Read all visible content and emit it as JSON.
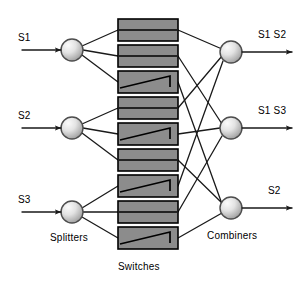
{
  "diagram": {
    "colors": {
      "line": "#1a1a1a",
      "switch_fill": "#8c8c8c",
      "switch_stroke": "#000000",
      "node_light": "#f2f2f2",
      "node_dark": "#9a9a9a",
      "node_stroke": "#4d4d4d",
      "text": "#000000",
      "background": "#ffffff"
    },
    "inputs": [
      {
        "label": "S1",
        "x": 18,
        "y": 33,
        "arrow_y": 50
      },
      {
        "label": "S2",
        "x": 18,
        "y": 111,
        "arrow_y": 128
      },
      {
        "label": "S3",
        "x": 18,
        "y": 195,
        "arrow_y": 212
      }
    ],
    "outputs": [
      {
        "label": "S1 S2",
        "x": 258,
        "y": 30,
        "arrow_y": 52
      },
      {
        "label": "S1 S3",
        "x": 258,
        "y": 106,
        "arrow_y": 128
      },
      {
        "label": "S2",
        "x": 268,
        "y": 186,
        "arrow_y": 208
      }
    ],
    "group_labels": [
      {
        "name": "splitters",
        "text": "Splitters",
        "x": 50,
        "y": 233
      },
      {
        "name": "switches",
        "text": "Switches",
        "x": 118,
        "y": 262
      },
      {
        "name": "combiners",
        "text": "Combiners",
        "x": 207,
        "y": 231
      }
    ],
    "splitters": [
      {
        "name": "splitter-1",
        "cx": 72,
        "cy": 50,
        "r": 11
      },
      {
        "name": "splitter-2",
        "cx": 72,
        "cy": 128,
        "r": 11
      },
      {
        "name": "splitter-3",
        "cx": 72,
        "cy": 212,
        "r": 11
      }
    ],
    "combiners": [
      {
        "name": "combiner-1",
        "cx": 231,
        "cy": 52,
        "r": 11
      },
      {
        "name": "combiner-2",
        "cx": 231,
        "cy": 128,
        "r": 11
      },
      {
        "name": "combiner-3",
        "cx": 231,
        "cy": 208,
        "r": 11
      }
    ],
    "switches": [
      {
        "name": "switch-1",
        "x": 118,
        "y": 19,
        "w": 60,
        "h": 22,
        "state": "bar"
      },
      {
        "name": "switch-2",
        "x": 118,
        "y": 45,
        "w": 60,
        "h": 22,
        "state": "bar"
      },
      {
        "name": "switch-3",
        "x": 118,
        "y": 71,
        "w": 60,
        "h": 22,
        "state": "cross"
      },
      {
        "name": "switch-4",
        "x": 118,
        "y": 97,
        "w": 60,
        "h": 22,
        "state": "bar"
      },
      {
        "name": "switch-5",
        "x": 118,
        "y": 123,
        "w": 60,
        "h": 22,
        "state": "cross"
      },
      {
        "name": "switch-6",
        "x": 118,
        "y": 149,
        "w": 60,
        "h": 22,
        "state": "bar"
      },
      {
        "name": "switch-7",
        "x": 118,
        "y": 175,
        "w": 60,
        "h": 22,
        "state": "cross"
      },
      {
        "name": "switch-8",
        "x": 118,
        "y": 201,
        "w": 60,
        "h": 22,
        "state": "bar"
      },
      {
        "name": "switch-9",
        "x": 118,
        "y": 227,
        "w": 60,
        "h": 22,
        "state": "cross"
      }
    ],
    "input_arrows": [
      {
        "name": "input-arrow-s1",
        "x1": 22,
        "y1": 50,
        "x2": 61,
        "y2": 50
      },
      {
        "name": "input-arrow-s2",
        "x1": 22,
        "y1": 128,
        "x2": 61,
        "y2": 128
      },
      {
        "name": "input-arrow-s3",
        "x1": 22,
        "y1": 212,
        "x2": 61,
        "y2": 212
      }
    ],
    "output_arrows": [
      {
        "name": "output-arrow-1",
        "x1": 242,
        "y1": 52,
        "x2": 292,
        "y2": 52
      },
      {
        "name": "output-arrow-2",
        "x1": 242,
        "y1": 128,
        "x2": 292,
        "y2": 128
      },
      {
        "name": "output-arrow-3",
        "x1": 242,
        "y1": 208,
        "x2": 292,
        "y2": 208
      }
    ],
    "splitter_links": [
      {
        "name": "link-sp1-sw1",
        "x1": 82,
        "y1": 46,
        "x2": 118,
        "y2": 30
      },
      {
        "name": "link-sp1-sw2",
        "x1": 83,
        "y1": 50,
        "x2": 118,
        "y2": 56
      },
      {
        "name": "link-sp1-sw3",
        "x1": 82,
        "y1": 55,
        "x2": 118,
        "y2": 82
      },
      {
        "name": "link-sp2-sw4",
        "x1": 82,
        "y1": 124,
        "x2": 118,
        "y2": 108
      },
      {
        "name": "link-sp2-sw5",
        "x1": 83,
        "y1": 128,
        "x2": 118,
        "y2": 134
      },
      {
        "name": "link-sp2-sw6",
        "x1": 82,
        "y1": 133,
        "x2": 118,
        "y2": 160
      },
      {
        "name": "link-sp3-sw7",
        "x1": 82,
        "y1": 208,
        "x2": 118,
        "y2": 186
      },
      {
        "name": "link-sp3-sw8",
        "x1": 83,
        "y1": 212,
        "x2": 118,
        "y2": 212
      },
      {
        "name": "link-sp3-sw9",
        "x1": 82,
        "y1": 217,
        "x2": 118,
        "y2": 238
      }
    ],
    "combiner_links": [
      {
        "name": "link-sw1-cb1",
        "x1": 178,
        "y1": 30,
        "x2": 222,
        "y2": 49
      },
      {
        "name": "link-sw2-cb2",
        "x1": 178,
        "y1": 56,
        "x2": 222,
        "y2": 124
      },
      {
        "name": "link-sw3-cb3",
        "x1": 178,
        "y1": 82,
        "x2": 222,
        "y2": 204
      },
      {
        "name": "link-sw4-cb1",
        "x1": 178,
        "y1": 108,
        "x2": 222,
        "y2": 56
      },
      {
        "name": "link-sw5-cb2",
        "x1": 178,
        "y1": 134,
        "x2": 220,
        "y2": 128
      },
      {
        "name": "link-sw6-cb3",
        "x1": 178,
        "y1": 160,
        "x2": 222,
        "y2": 203
      },
      {
        "name": "link-sw7-cb1",
        "x1": 178,
        "y1": 186,
        "x2": 223,
        "y2": 61
      },
      {
        "name": "link-sw8-cb2",
        "x1": 178,
        "y1": 212,
        "x2": 222,
        "y2": 136
      },
      {
        "name": "link-sw9-cb3",
        "x1": 178,
        "y1": 238,
        "x2": 222,
        "y2": 213
      }
    ]
  }
}
